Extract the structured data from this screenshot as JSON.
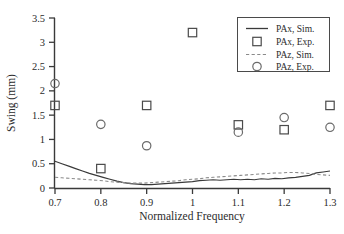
{
  "chart_data": {
    "type": "scatter",
    "title": "",
    "xlabel": "Normalized Frequency",
    "ylabel": "Swing (mm)",
    "xlim": [
      0.7,
      1.3
    ],
    "ylim": [
      0,
      3.5
    ],
    "xticks": [
      0.7,
      0.8,
      0.9,
      1.0,
      1.1,
      1.2,
      1.3
    ],
    "xtick_labels": [
      "0.7",
      "0.8",
      "0.9",
      "1",
      "1.1",
      "1.2",
      "1.3"
    ],
    "yticks": [
      0,
      0.5,
      1,
      1.5,
      2,
      2.5,
      3,
      3.5
    ],
    "ytick_labels": [
      "0",
      "0.5",
      "1",
      "1.5",
      "2",
      "2.5",
      "3",
      "3.5"
    ],
    "grid": false,
    "legend_position": "top-right",
    "series": [
      {
        "name": "PAx, Sim.",
        "kind": "line",
        "style": "solid",
        "color": "#3a3a3a",
        "x": [
          0.7,
          0.715,
          0.73,
          0.745,
          0.76,
          0.775,
          0.79,
          0.805,
          0.82,
          0.835,
          0.85,
          0.865,
          0.88,
          0.895,
          0.91,
          0.925,
          0.94,
          0.955,
          0.97,
          0.985,
          1.0,
          1.015,
          1.03,
          1.045,
          1.06,
          1.075,
          1.09,
          1.105,
          1.12,
          1.135,
          1.15,
          1.165,
          1.18,
          1.195,
          1.21,
          1.225,
          1.24,
          1.255,
          1.27,
          1.285,
          1.3
        ],
        "values": [
          0.55,
          0.5,
          0.45,
          0.4,
          0.35,
          0.3,
          0.26,
          0.22,
          0.18,
          0.14,
          0.11,
          0.09,
          0.08,
          0.07,
          0.07,
          0.08,
          0.09,
          0.1,
          0.11,
          0.12,
          0.13,
          0.15,
          0.16,
          0.17,
          0.16,
          0.17,
          0.18,
          0.17,
          0.18,
          0.17,
          0.19,
          0.18,
          0.2,
          0.19,
          0.21,
          0.22,
          0.24,
          0.26,
          0.31,
          0.33,
          0.35
        ]
      },
      {
        "name": "PAz, Sim.",
        "kind": "line",
        "style": "dashed",
        "color": "#8a8a8a",
        "x": [
          0.7,
          0.715,
          0.73,
          0.745,
          0.76,
          0.775,
          0.79,
          0.805,
          0.82,
          0.835,
          0.85,
          0.865,
          0.88,
          0.895,
          0.91,
          0.925,
          0.94,
          0.955,
          0.97,
          0.985,
          1.0,
          1.015,
          1.03,
          1.045,
          1.06,
          1.075,
          1.09,
          1.105,
          1.12,
          1.135,
          1.15,
          1.165,
          1.18,
          1.195,
          1.21,
          1.225,
          1.24,
          1.255,
          1.27,
          1.285,
          1.3
        ],
        "values": [
          0.22,
          0.21,
          0.2,
          0.19,
          0.18,
          0.17,
          0.16,
          0.15,
          0.13,
          0.12,
          0.11,
          0.1,
          0.1,
          0.1,
          0.11,
          0.12,
          0.13,
          0.14,
          0.15,
          0.17,
          0.18,
          0.19,
          0.21,
          0.22,
          0.23,
          0.24,
          0.25,
          0.26,
          0.27,
          0.28,
          0.29,
          0.3,
          0.31,
          0.31,
          0.32,
          0.32,
          0.31,
          0.3,
          0.28,
          0.27,
          0.26
        ]
      },
      {
        "name": "PAx, Exp.",
        "kind": "scatter",
        "marker": "square",
        "color": "#4a4a4a",
        "x": [
          0.7,
          0.8,
          0.9,
          1.0,
          1.1,
          1.2,
          1.3
        ],
        "values": [
          1.7,
          0.4,
          1.7,
          3.2,
          1.3,
          1.2,
          1.7
        ]
      },
      {
        "name": "PAz, Exp.",
        "kind": "scatter",
        "marker": "circle",
        "color": "#6a6a6a",
        "x": [
          0.7,
          0.8,
          0.9,
          1.0,
          1.1,
          1.2,
          1.3
        ],
        "values": [
          2.15,
          1.31,
          0.87,
          null,
          1.15,
          1.45,
          1.25
        ]
      }
    ],
    "legend_entries": [
      {
        "label": "PAx, Sim.",
        "type": "solid-line"
      },
      {
        "label": "PAx, Exp.",
        "type": "square-marker"
      },
      {
        "label": "PAz, Sim.",
        "type": "dashed-line"
      },
      {
        "label": "PAz, Exp.",
        "type": "circle-marker"
      }
    ]
  }
}
